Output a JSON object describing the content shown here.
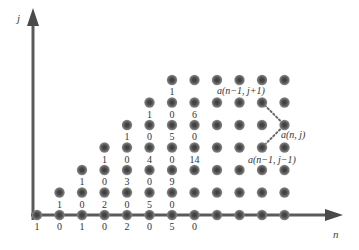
{
  "axes": {
    "x_label": "n",
    "y_label": "j",
    "color": "#5a5a5a"
  },
  "grid": {
    "origin_x": 37,
    "origin_y": 215,
    "col_spacing": 22.5,
    "row_spacing": 22.5,
    "max_col": 11,
    "max_row": 6,
    "dot_color": "#6e6e6e",
    "dot_core": "#3a3a3a"
  },
  "rows": [
    {
      "j": 0,
      "start_col": 0,
      "labels": [
        "1",
        "0",
        "1",
        "0",
        "2",
        "0",
        "5",
        "0"
      ]
    },
    {
      "j": 1,
      "start_col": 1,
      "labels": [
        "1",
        "0",
        "2",
        "0",
        "5",
        "0"
      ]
    },
    {
      "j": 2,
      "start_col": 2,
      "labels": [
        "1",
        "0",
        "3",
        "0",
        "9"
      ]
    },
    {
      "j": 3,
      "start_col": 3,
      "labels": [
        "1",
        "0",
        "4",
        "0",
        "14"
      ]
    },
    {
      "j": 4,
      "start_col": 4,
      "labels": [
        "1",
        "0",
        "5",
        "0"
      ]
    },
    {
      "j": 5,
      "start_col": 5,
      "labels": [
        "1",
        "0",
        "6"
      ]
    },
    {
      "j": 6,
      "start_col": 6,
      "labels": [
        "1"
      ]
    }
  ],
  "annotation": {
    "target": {
      "col": 11,
      "row": 4,
      "label": "a(n, j)"
    },
    "upper": {
      "col": 10,
      "row": 5,
      "label": "a(n−1, j+1)"
    },
    "lower": {
      "col": 10,
      "row": 3,
      "label": "a(n−1, j−1)"
    }
  }
}
